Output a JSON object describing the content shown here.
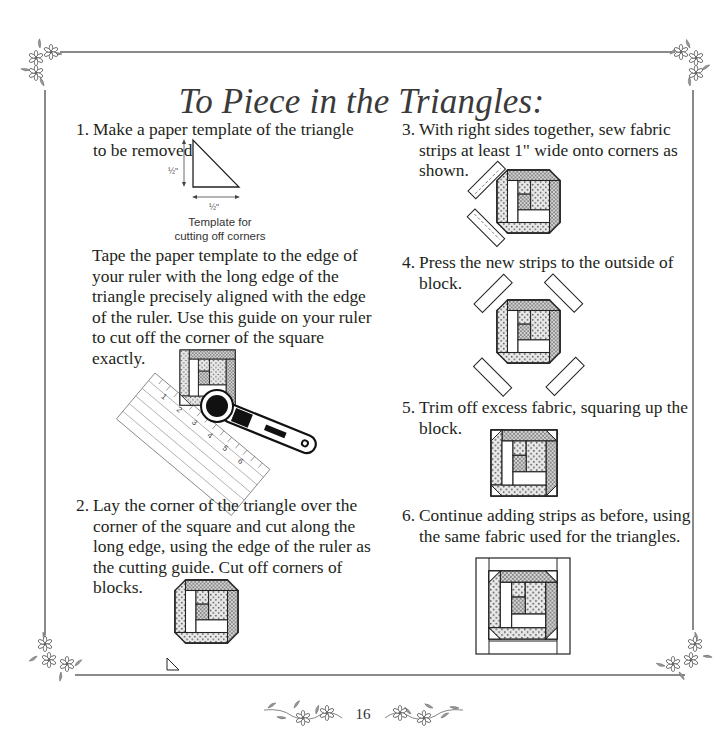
{
  "page": {
    "title": "To Piece in the Triangles:",
    "page_number": "16",
    "frame_color": "#8a8a8a"
  },
  "steps": [
    {
      "number": "1.",
      "text": "Make a paper template of the triangle to be removed.",
      "figure": {
        "dim_vertical": "½\"",
        "dim_horizontal": "½\"",
        "caption_line1": "Template for",
        "caption_line2": "cutting off corners"
      },
      "paragraph": "Tape the paper template to the edge of your ruler with the long edge of the triangle precisely aligned with the edge of the ruler. Use this guide on your ruler to cut off the corner of the square exactly.",
      "ruler_marks": [
        "1",
        "2",
        "1",
        "2",
        "3",
        "4",
        "5",
        "6"
      ]
    },
    {
      "number": "2.",
      "text": "Lay the corner of the triangle over the corner of the square and cut along the long edge, using the edge of the ruler as the cutting guide. Cut off corners of blocks."
    },
    {
      "number": "3.",
      "text": "With right sides together, sew fabric strips at least 1\" wide onto corners as shown."
    },
    {
      "number": "4.",
      "text": "Press the new strips to the outside of block."
    },
    {
      "number": "5.",
      "text": "Trim off excess fabric, squaring up the block."
    },
    {
      "number": "6.",
      "text": "Continue adding strips as before, using the same fabric used for the triangles."
    }
  ],
  "icons": {
    "corner_ornament": "floral-corner",
    "footer_ornament": "floral-vine"
  }
}
